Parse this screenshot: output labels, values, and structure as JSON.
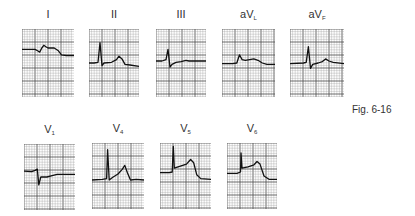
{
  "figure": {
    "caption": "Fig. 6-16",
    "grid": {
      "minor_color": "#9a9a9a",
      "major_color": "#4a4a4a",
      "trace_color": "#111111"
    },
    "rows": [
      {
        "leads": [
          {
            "id": "I",
            "label": "I",
            "sub": "",
            "trace": "small positive QRS, ST elevation, T merging with ST"
          },
          {
            "id": "II",
            "label": "II",
            "sub": "",
            "trace": "tall R, small S, ST elevation with upright T"
          },
          {
            "id": "III",
            "label": "III",
            "sub": "",
            "trace": "R then deep S, slight ST elevation"
          },
          {
            "id": "aVL",
            "label": "aV",
            "sub": "L",
            "trace": "small notched QRS, ST elevation"
          },
          {
            "id": "aVF",
            "label": "aV",
            "sub": "F",
            "trace": "RS complex, ST elevation with upright T"
          }
        ]
      },
      {
        "leads": [
          {
            "id": "V1",
            "label": "V",
            "sub": "1",
            "trace": "rS complex, slight ST elevation"
          },
          {
            "id": "V4",
            "label": "V",
            "sub": "4",
            "trace": "tall R, ST elevation with peaked T"
          },
          {
            "id": "V5",
            "label": "V",
            "sub": "5",
            "trace": "tall R, marked ST elevation (tombstone)"
          },
          {
            "id": "V6",
            "label": "V",
            "sub": "6",
            "trace": "tall R, marked ST elevation (tombstone)"
          }
        ]
      }
    ]
  }
}
